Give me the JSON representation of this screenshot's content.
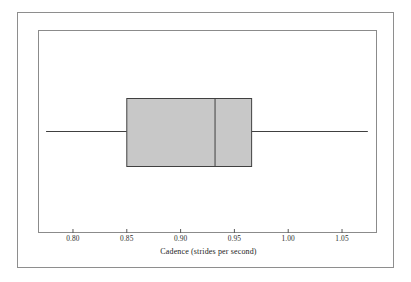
{
  "figure": {
    "type": "boxplot-figure",
    "background_color": "#ffffff",
    "frame_color": "#8b8b8b",
    "box_fill_color": "#c8c8c8",
    "line_color": "#404040"
  },
  "axis": {
    "title": "Cadence (strides per second)",
    "tick_labels": [
      "0.80",
      "0.85",
      "0.90",
      "0.95",
      "1.00",
      "1.05"
    ],
    "tick_values": [
      0.8,
      0.85,
      0.9,
      0.95,
      1.0,
      1.05
    ]
  },
  "chart_data": {
    "type": "box",
    "title": "",
    "subtitle": "",
    "xlabel": "Cadence (strides per second)",
    "ylabel": "",
    "orientation": "horizontal",
    "xlim": [
      0.7675,
      1.0825
    ],
    "grid": false,
    "legend": null,
    "categories": [
      "Cadence"
    ],
    "series": [
      {
        "name": "Cadence",
        "whisker_low": 0.775,
        "q1": 0.85,
        "median": 0.932,
        "q3": 0.966,
        "whisker_high": 1.074,
        "outliers": [],
        "fill": "#c8c8c8",
        "edge": "#404040"
      }
    ],
    "axis_ticks": {
      "x": [
        0.8,
        0.85,
        0.9,
        0.95,
        1.0,
        1.05
      ]
    },
    "tick_label_format": "0.00"
  }
}
